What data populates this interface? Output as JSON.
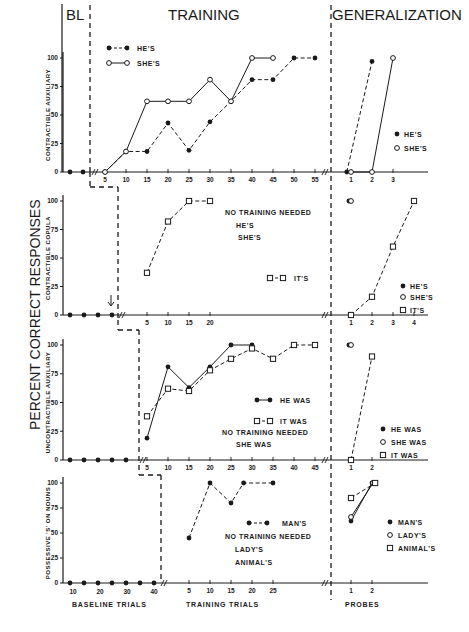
{
  "chart_data": {
    "type": "line",
    "title": "",
    "ylabel": "PERCENT CORRECT RESPONSES",
    "section_headers": [
      "BL",
      "TRAINING",
      "GENERALIZATION"
    ],
    "x_axis_labels": {
      "baseline": "BASELINE TRIALS",
      "training": "TRAINING TRIALS",
      "probes": "PROBES"
    },
    "ylim": [
      0,
      100
    ],
    "yticks": [
      0,
      25,
      50,
      75,
      100
    ],
    "panels": [
      {
        "ylabel": "CONTRACTIBLE AUXILIARY",
        "baseline": {
          "n_points": 2,
          "values": [
            0,
            0
          ]
        },
        "training": {
          "xticks": [
            5,
            10,
            15,
            20,
            25,
            30,
            35,
            40,
            45,
            50,
            55
          ],
          "series": [
            {
              "name": "HE'S",
              "marker": "filled-circle",
              "line": "dashed",
              "x": [
                5,
                10,
                15,
                20,
                25,
                30,
                35,
                40,
                45,
                50,
                55
              ],
              "values": [
                0,
                18,
                18,
                43,
                19,
                44,
                62,
                81,
                81,
                100,
                100
              ]
            },
            {
              "name": "SHE'S",
              "marker": "open-circle",
              "line": "solid",
              "x": [
                5,
                10,
                15,
                20,
                25,
                30,
                35,
                40,
                45
              ],
              "values": [
                0,
                18,
                62,
                62,
                62,
                81,
                62,
                100,
                100
              ]
            }
          ],
          "legend": [
            "HE'S",
            "SHE'S"
          ]
        },
        "generalization": {
          "xticks": [
            1,
            2,
            3
          ],
          "series": [
            {
              "name": "HE'S",
              "marker": "filled-circle",
              "line": "dashed",
              "x": [
                0.8,
                2
              ],
              "values": [
                0,
                97
              ]
            },
            {
              "name": "SHE'S",
              "marker": "open-circle",
              "line": "solid",
              "x": [
                1,
                2,
                3
              ],
              "values": [
                0,
                0,
                100
              ]
            }
          ],
          "legend": [
            "HE'S",
            "SHE'S"
          ]
        }
      },
      {
        "ylabel": "CONTRACTIBLE COPULA",
        "baseline": {
          "n_points": 4,
          "values": [
            0,
            0,
            0,
            0
          ],
          "arrow_annotation": true
        },
        "training": {
          "xticks": [
            5,
            10,
            15,
            20
          ],
          "series": [
            {
              "name": "IT'S",
              "marker": "open-square",
              "line": "dashed",
              "x": [
                5,
                10,
                15,
                20
              ],
              "values": [
                37,
                82,
                100,
                100
              ]
            }
          ],
          "legend": [
            "IT'S"
          ],
          "note": [
            "NO TRAINING NEEDED",
            "HE'S",
            "SHE'S"
          ]
        },
        "generalization": {
          "xticks": [
            1,
            2,
            3,
            4
          ],
          "series": [
            {
              "name": "HE'S",
              "marker": "filled-circle",
              "x": [
                0.9
              ],
              "values": [
                100
              ]
            },
            {
              "name": "SHE'S",
              "marker": "open-circle",
              "x": [
                1
              ],
              "values": [
                100
              ]
            },
            {
              "name": "IT'S",
              "marker": "open-square",
              "line": "dashed",
              "x": [
                1,
                2,
                3,
                4
              ],
              "values": [
                0,
                16,
                60,
                100
              ]
            }
          ],
          "legend": [
            "HE'S",
            "SHE'S",
            "IT'S"
          ]
        }
      },
      {
        "ylabel": "UNCONTRACTIBLE AUXILIARY",
        "baseline": {
          "n_points": 5,
          "values": [
            0,
            0,
            0,
            0,
            0
          ]
        },
        "training": {
          "xticks": [
            5,
            10,
            15,
            20,
            25,
            30,
            35,
            40,
            45
          ],
          "series": [
            {
              "name": "HE WAS",
              "marker": "filled-circle",
              "line": "solid",
              "x": [
                5,
                10,
                15,
                20,
                25,
                30
              ],
              "values": [
                19,
                81,
                63,
                81,
                100,
                100
              ]
            },
            {
              "name": "IT WAS",
              "marker": "open-square",
              "line": "dashed",
              "x": [
                5,
                10,
                15,
                20,
                25,
                30,
                35,
                40,
                45
              ],
              "values": [
                38,
                62,
                60,
                78,
                88,
                97,
                88,
                100,
                100
              ]
            }
          ],
          "legend": [
            "HE WAS",
            "IT WAS"
          ],
          "note": [
            "NO TRAINING NEEDED",
            "SHE WAS"
          ]
        },
        "generalization": {
          "xticks": [
            1,
            2
          ],
          "series": [
            {
              "name": "HE WAS",
              "marker": "filled-circle",
              "x": [
                0.9
              ],
              "values": [
                100
              ]
            },
            {
              "name": "SHE WAS",
              "marker": "open-circle",
              "x": [
                1
              ],
              "values": [
                100
              ]
            },
            {
              "name": "IT WAS",
              "marker": "open-square",
              "line": "dashed",
              "x": [
                1,
                2
              ],
              "values": [
                0,
                90
              ]
            }
          ],
          "legend": [
            "HE WAS",
            "SHE WAS",
            "IT WAS"
          ]
        }
      },
      {
        "ylabel": "POSSESSIVE 'S' ON NOUNS",
        "baseline": {
          "xticks": [
            10,
            20,
            30,
            40
          ],
          "n_points": 7,
          "values": [
            0,
            0,
            0,
            0,
            0,
            0,
            0
          ]
        },
        "training": {
          "xticks": [
            5,
            10,
            15,
            20,
            25
          ],
          "series": [
            {
              "name": "MAN'S",
              "marker": "filled-circle",
              "line": "dashed",
              "x": [
                5,
                10,
                15,
                18,
                25
              ],
              "values": [
                45,
                100,
                80,
                100,
                100
              ]
            }
          ],
          "legend": [
            "MAN'S"
          ],
          "note": [
            "NO TRAINING NEEDED",
            "LADY'S",
            "ANIMAL'S"
          ]
        },
        "generalization": {
          "xticks": [
            1,
            2
          ],
          "series": [
            {
              "name": "MAN'S",
              "marker": "filled-circle",
              "line": "solid",
              "x": [
                1,
                2
              ],
              "values": [
                62,
                100
              ]
            },
            {
              "name": "LADY'S",
              "marker": "open-circle",
              "line": "solid",
              "x": [
                1,
                2.05
              ],
              "values": [
                66,
                100
              ]
            },
            {
              "name": "ANIMAL'S",
              "marker": "open-square",
              "line": "dashed",
              "x": [
                1,
                2.15
              ],
              "values": [
                85,
                100
              ]
            }
          ],
          "legend": [
            "MAN'S",
            "LADY'S",
            "ANIMAL'S"
          ]
        }
      }
    ]
  }
}
